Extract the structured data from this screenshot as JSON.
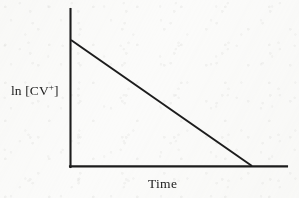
{
  "figure": {
    "background_color": "#fbfbfa",
    "ink_color": "#1c1c1c"
  },
  "labels": {
    "y_axis_base": "ln [CV",
    "y_axis_superscript": "+",
    "y_axis_close": "]",
    "x_axis": "Time"
  },
  "chart_data": {
    "type": "line",
    "title": "",
    "subtitle": "",
    "xlabel": "Time",
    "ylabel": "ln [CV+]",
    "grid": false,
    "legend": null,
    "tick_labels": {
      "x": [],
      "y": []
    },
    "axes": {
      "x_range_drawn_px": [
        70,
        287
      ],
      "y_range_drawn_px": [
        9,
        167
      ],
      "origin_px": [
        70,
        167
      ],
      "x_axis_visible": true,
      "y_axis_visible": true,
      "tick_marks": false
    },
    "annotations": [],
    "series": [
      {
        "name": "ln [CV+] vs Time",
        "style": "solid",
        "color": "#1c1c1c",
        "line_width_px": 2,
        "markers": false,
        "x": [
          0,
          1
        ],
        "y": [
          1,
          0
        ],
        "endpoints_px": [
          [
            71,
            40
          ],
          [
            252,
            166
          ]
        ],
        "description": "straight descending line indicating first-order decay"
      }
    ],
    "xlim": [
      0,
      1.2
    ],
    "ylim": [
      0,
      1.25
    ]
  }
}
